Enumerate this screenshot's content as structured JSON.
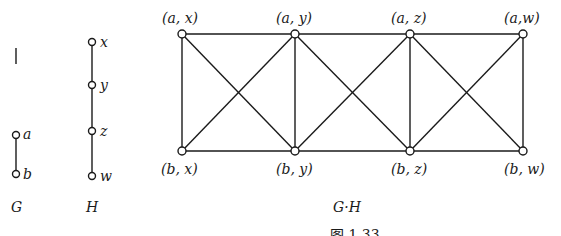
{
  "graph_G": {
    "title": "G",
    "nodes": [
      {
        "id": "a",
        "label": "a"
      },
      {
        "id": "b",
        "label": "b"
      }
    ],
    "edges": [
      [
        "a",
        "b"
      ]
    ]
  },
  "graph_H": {
    "title": "H",
    "nodes": [
      {
        "id": "x",
        "label": "x"
      },
      {
        "id": "y",
        "label": "y"
      },
      {
        "id": "z",
        "label": "z"
      },
      {
        "id": "w",
        "label": "w"
      }
    ],
    "edges": [
      [
        "x",
        "y"
      ],
      [
        "y",
        "z"
      ],
      [
        "z",
        "w"
      ]
    ]
  },
  "graph_product": {
    "title": "G·H",
    "nodes": [
      {
        "id": "ax",
        "label": "(a, x)"
      },
      {
        "id": "ay",
        "label": "(a, y)"
      },
      {
        "id": "az",
        "label": "(a, z)"
      },
      {
        "id": "aw",
        "label": "(a,w)"
      },
      {
        "id": "bx",
        "label": "(b, x)"
      },
      {
        "id": "by",
        "label": "(b, y)"
      },
      {
        "id": "bz",
        "label": "(b, z)"
      },
      {
        "id": "bw",
        "label": "(b, w)"
      }
    ],
    "edges": [
      [
        "ax",
        "ay"
      ],
      [
        "ay",
        "az"
      ],
      [
        "az",
        "aw"
      ],
      [
        "bx",
        "by"
      ],
      [
        "by",
        "bz"
      ],
      [
        "bz",
        "bw"
      ],
      [
        "ax",
        "bx"
      ],
      [
        "ay",
        "by"
      ],
      [
        "az",
        "bz"
      ],
      [
        "aw",
        "bw"
      ],
      [
        "ax",
        "by"
      ],
      [
        "bx",
        "ay"
      ],
      [
        "ay",
        "bz"
      ],
      [
        "by",
        "az"
      ],
      [
        "az",
        "bw"
      ],
      [
        "bz",
        "aw"
      ]
    ]
  },
  "caption": "图 1.33"
}
